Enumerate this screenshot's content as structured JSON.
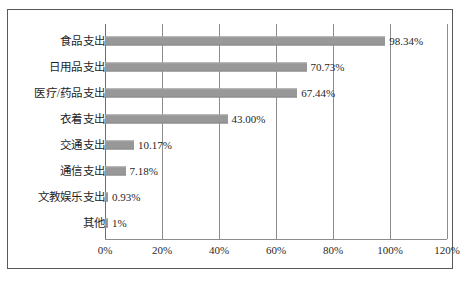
{
  "chart_data": {
    "type": "bar",
    "orientation": "horizontal",
    "title": "",
    "subtitle": "",
    "xlabel": "",
    "ylabel": "",
    "categories": [
      "食品支出",
      "日用品支出",
      "医疗/药品支出",
      "衣着支出",
      "交通支出",
      "通信支出",
      "文教娱乐支出",
      "其他"
    ],
    "values": [
      98.34,
      70.73,
      67.44,
      43.0,
      10.17,
      7.18,
      0.93,
      1
    ],
    "value_labels": [
      "98.34%",
      "70.73%",
      "67.44%",
      "43.00%",
      "10.17%",
      "7.18%",
      "0.93%",
      "1%"
    ],
    "xlim": [
      0,
      120
    ],
    "xticks": [
      0,
      20,
      40,
      60,
      80,
      100,
      120
    ],
    "xtick_labels": [
      "0%",
      "20%",
      "40%",
      "60%",
      "80%",
      "100%",
      "120%"
    ],
    "grid": true,
    "grid_axis": "x",
    "legend": false,
    "series": [
      {
        "name": "",
        "values": [
          98.34,
          70.73,
          67.44,
          43.0,
          10.17,
          7.18,
          0.93,
          1
        ]
      }
    ],
    "colors": {
      "bar_fill": "#989898",
      "gridline": "#8c8c8c",
      "border": "#595959",
      "text": "#1f1f1f",
      "background": "#ffffff"
    }
  }
}
